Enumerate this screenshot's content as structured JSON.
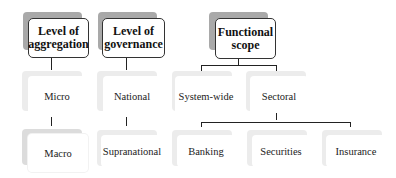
{
  "diagram": {
    "top_nodes": [
      {
        "id": "aggregation",
        "label_line1": "Level of",
        "label_line2": "aggregation"
      },
      {
        "id": "governance",
        "label_line1": "Level of",
        "label_line2": "governance"
      },
      {
        "id": "scope",
        "label_line1": "Functional",
        "label_line2": "scope"
      }
    ],
    "level2": {
      "micro": "Micro",
      "national": "National",
      "system_wide": "System-wide",
      "sectoral": "Sectoral"
    },
    "level3": {
      "macro": "Macro",
      "supranational": "Supranational",
      "banking": "Banking",
      "securities": "Securities",
      "insurance": "Insurance"
    }
  }
}
